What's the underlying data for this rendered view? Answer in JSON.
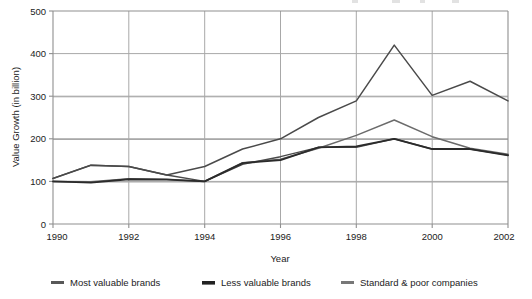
{
  "chart_data": {
    "type": "line",
    "title": "",
    "xlabel": "Year",
    "ylabel": "Value Growth (in billion)",
    "x": [
      1990,
      1991,
      1992,
      1993,
      1994,
      1995,
      1996,
      1997,
      1998,
      1999,
      2000,
      2001,
      2002
    ],
    "xlim": [
      1990,
      2002
    ],
    "ylim": [
      0,
      500
    ],
    "xticks": [
      "1990",
      "1992",
      "1994",
      "1996",
      "1998",
      "2000",
      "2002"
    ],
    "xtick_values": [
      1990,
      1992,
      1994,
      1996,
      1998,
      2000,
      2002
    ],
    "yticks": [
      "0",
      "100",
      "200",
      "300",
      "400",
      "500"
    ],
    "ytick_values": [
      0,
      100,
      200,
      300,
      400,
      500
    ],
    "grid": true,
    "grid_axis": "both",
    "legend_position": "below",
    "series": [
      {
        "name": "Most valuable brands",
        "color": "#4a4a4a",
        "width": 1.4,
        "values": [
          107,
          138,
          135,
          115,
          100,
          140,
          158,
          180,
          180,
          200,
          176,
          176,
          162
        ]
      },
      {
        "name": "Less valuable brands",
        "color": "#2b2b2b",
        "width": 1.8,
        "values": [
          100,
          97,
          105,
          104,
          100,
          143,
          150,
          180,
          182,
          200,
          176,
          176,
          161
        ]
      },
      {
        "name": "Standard & poor companies",
        "color": "#6b6b6b",
        "width": 1.5,
        "values": [
          100,
          99,
          106,
          105,
          100,
          144,
          152,
          178,
          208,
          244,
          205,
          178,
          164
        ]
      },
      {
        "name": "Top line",
        "color": "#4a4a4a",
        "width": 1.5,
        "values": [
          107,
          138,
          135,
          115,
          135,
          176,
          200,
          250,
          289,
          420,
          302,
          335,
          289
        ]
      }
    ]
  },
  "legend": {
    "items": [
      {
        "label": "Most valuable brands",
        "color": "#585858"
      },
      {
        "label": "Less valuable brands",
        "color": "#222222"
      },
      {
        "label": "Standard & poor companies",
        "color": "#777777"
      }
    ]
  },
  "axes": {
    "y_title": "Value Growth (in billion)",
    "x_title": "Year",
    "y_ticks": [
      "500",
      "400",
      "300",
      "200",
      "100",
      "0"
    ],
    "x_ticks": [
      "1990",
      "1992",
      "1994",
      "1996",
      "1998",
      "2000",
      "2002"
    ]
  },
  "colors": {
    "plot_border": "#9a9a9a",
    "gridline": "#a8a8a8",
    "text": "#1c1c1c",
    "background": "#ffffff"
  }
}
